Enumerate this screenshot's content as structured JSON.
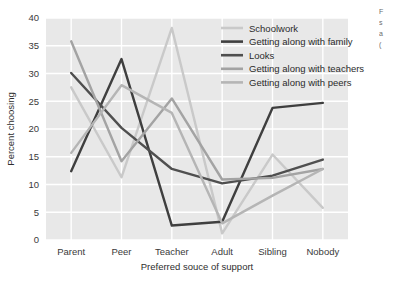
{
  "chart_data": {
    "type": "line",
    "title": "",
    "xlabel": "Preferred souce of support",
    "ylabel": "Percent choosing",
    "categories": [
      "Parent",
      "Peer",
      "Teacher",
      "Adult",
      "Sibling",
      "Nobody"
    ],
    "ylim": [
      0,
      40
    ],
    "yticks": [
      0,
      5,
      10,
      15,
      20,
      25,
      30,
      35,
      40
    ],
    "grid": true,
    "legend_position": "top-right",
    "plot_background": "#e8e8e8",
    "gridline_color": "#ffffff",
    "series": [
      {
        "name": "Schoolwork",
        "color": "#c9c9c9",
        "values": [
          27.5,
          11.3,
          38.2,
          1.2,
          15.4,
          5.8
        ]
      },
      {
        "name": "Getting along with family",
        "color": "#3f3f3f",
        "values": [
          12.4,
          32.6,
          2.6,
          3.3,
          23.8,
          24.7
        ]
      },
      {
        "name": "Looks",
        "color": "#4f4f4f",
        "values": [
          30.1,
          20.2,
          12.8,
          10.2,
          11.6,
          14.5
        ]
      },
      {
        "name": "Getting along with teachers",
        "color": "#a3a3a3",
        "values": [
          35.8,
          14.2,
          25.5,
          10.9,
          11.2,
          12.8
        ]
      },
      {
        "name": "Getting along with peers",
        "color": "#b5b5b5",
        "values": [
          15.7,
          27.9,
          22.9,
          3.0,
          8.0,
          12.8
        ]
      }
    ]
  },
  "axes": {
    "ytick_labels": [
      "0",
      "5",
      "10",
      "15",
      "20",
      "25",
      "30",
      "35",
      "40"
    ],
    "xtick_labels": [
      "Parent",
      "Peer",
      "Teacher",
      "Adult",
      "Sibling",
      "Nobody"
    ],
    "ylabel": "Percent choosing",
    "xlabel": "Preferred souce of support"
  },
  "legend": {
    "items": [
      {
        "label": "Schoolwork"
      },
      {
        "label": "Getting along with family"
      },
      {
        "label": "Looks"
      },
      {
        "label": "Getting along with teachers"
      },
      {
        "label": "Getting along with peers"
      }
    ]
  },
  "caption_fragment": {
    "lines": [
      "F",
      "s",
      "a",
      "("
    ]
  }
}
